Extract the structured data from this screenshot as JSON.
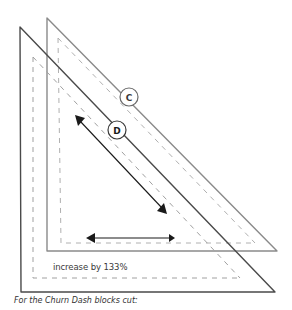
{
  "diagram": {
    "templates": [
      {
        "id": "C",
        "label": "C",
        "role": "back triangle template"
      },
      {
        "id": "D",
        "label": "D",
        "role": "front triangle template"
      }
    ],
    "annotation": "increase by 133%",
    "caption": "For the Churn Dash blocks cut:",
    "colors": {
      "back_outline": "#8a8a8a",
      "front_outline": "#4a4a4a",
      "dashed_seam": "#a8a8a8",
      "arrow": "#1a1a1a"
    }
  }
}
